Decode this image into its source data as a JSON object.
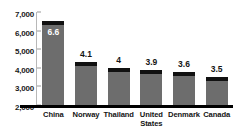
{
  "chart_data": {
    "type": "bar",
    "title": "",
    "subtitle": "",
    "xlabel": "",
    "ylabel": "",
    "categories": [
      "China",
      "Norway",
      "Thailand",
      "United States",
      "Denmark",
      "Canada"
    ],
    "values": [
      6500,
      4300,
      4000,
      3870,
      3760,
      3490
    ],
    "data_labels": [
      "6.6",
      "4.1",
      "4",
      "3.9",
      "3.6",
      "3.5"
    ],
    "ylim": [
      2000,
      7000
    ],
    "yticks": [
      7000,
      6000,
      5000,
      4000,
      3000,
      2000
    ],
    "ytick_labels": [
      "7,000",
      "6,000",
      "5,000",
      "4,000",
      "3,000",
      "2,000"
    ],
    "grid": false,
    "legend": false,
    "series": [
      {
        "name": "value",
        "values": [
          6500,
          4300,
          4000,
          3870,
          3760,
          3490
        ]
      }
    ],
    "colors": {
      "bar_fill": "#6d6d6d",
      "bar_cap": "#111111",
      "axis": "#000000",
      "tick": "#9a9a9a",
      "text": "#141414",
      "inside_label": "#ffffff"
    }
  },
  "axis": {
    "ticks": [
      {
        "label": "7,000",
        "value": 7000
      },
      {
        "label": "6,000",
        "value": 6000
      },
      {
        "label": "5,000",
        "value": 5000
      },
      {
        "label": "4,000",
        "value": 4000
      },
      {
        "label": "3,000",
        "value": 3000
      },
      {
        "label": "2,000",
        "value": 2000
      }
    ]
  },
  "bars": [
    {
      "category": "China",
      "label": "6.6",
      "value": 6500,
      "label_position": "inside"
    },
    {
      "category": "Norway",
      "label": "4.1",
      "value": 4300,
      "label_position": "outside"
    },
    {
      "category": "Thailand",
      "label": "4",
      "value": 4000,
      "label_position": "outside"
    },
    {
      "category": "United States",
      "label": "3.9",
      "value": 3870,
      "label_position": "outside"
    },
    {
      "category": "Denmark",
      "label": "3.6",
      "value": 3760,
      "label_position": "outside"
    },
    {
      "category": "Canada",
      "label": "3.5",
      "value": 3490,
      "label_position": "outside"
    }
  ]
}
